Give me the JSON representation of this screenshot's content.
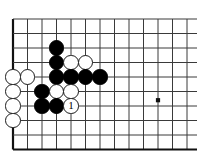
{
  "board": {
    "title": "Go board diagram",
    "background_color": "#ffffff",
    "line_color": "#3a3a3a",
    "edge_color": "#111111",
    "black_color": "#000000",
    "white_color": "#ffffff",
    "geometry": {
      "origin_x": 13,
      "origin_y": 19,
      "spacing": 14.5,
      "cols": 13,
      "rows": 10,
      "stone_radius": 7.6,
      "edge_width": 2.2,
      "line_width": 1.0
    },
    "star_points": [
      {
        "col": 10,
        "row": 5.6
      }
    ],
    "stones": [
      {
        "color": "black",
        "col": 3,
        "row": 2,
        "label": ""
      },
      {
        "color": "black",
        "col": 3,
        "row": 3,
        "label": ""
      },
      {
        "color": "white",
        "col": 4,
        "row": 3,
        "label": ""
      },
      {
        "color": "white",
        "col": 5,
        "row": 3,
        "label": ""
      },
      {
        "color": "white",
        "col": 0,
        "row": 4,
        "label": ""
      },
      {
        "color": "white",
        "col": 1,
        "row": 4,
        "label": ""
      },
      {
        "color": "black",
        "col": 3,
        "row": 4,
        "label": ""
      },
      {
        "color": "black",
        "col": 4,
        "row": 4,
        "label": ""
      },
      {
        "color": "black",
        "col": 5,
        "row": 4,
        "label": ""
      },
      {
        "color": "black",
        "col": 6,
        "row": 4,
        "label": ""
      },
      {
        "color": "white",
        "col": 0,
        "row": 5,
        "label": ""
      },
      {
        "color": "black",
        "col": 2,
        "row": 5,
        "label": ""
      },
      {
        "color": "white",
        "col": 3,
        "row": 5,
        "label": ""
      },
      {
        "color": "white",
        "col": 4,
        "row": 5,
        "label": ""
      },
      {
        "color": "white",
        "col": 0,
        "row": 6,
        "label": ""
      },
      {
        "color": "black",
        "col": 2,
        "row": 6,
        "label": ""
      },
      {
        "color": "black",
        "col": 3,
        "row": 6,
        "label": ""
      },
      {
        "color": "white",
        "col": 4,
        "row": 6,
        "label": "1"
      },
      {
        "color": "white",
        "col": 0,
        "row": 7,
        "label": ""
      }
    ]
  }
}
